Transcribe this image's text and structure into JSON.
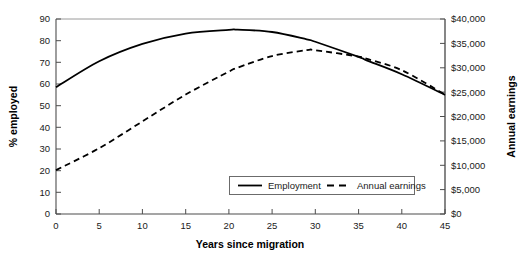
{
  "chart_data": {
    "type": "line",
    "title": "",
    "xlabel": "Years since migration",
    "ylabel": "% employed",
    "y2label": "Annual earnings",
    "xlim": [
      0,
      45
    ],
    "ylim": [
      0,
      90
    ],
    "y2lim": [
      0,
      40000
    ],
    "grid": false,
    "legend_position": "inside-bottom-center",
    "x_ticks": [
      "0",
      "5",
      "10",
      "15",
      "20",
      "25",
      "30",
      "35",
      "40",
      "45"
    ],
    "x_tick_values": [
      0,
      5,
      10,
      15,
      20,
      25,
      30,
      35,
      40,
      45
    ],
    "y_ticks": [
      "0",
      "10",
      "20",
      "30",
      "40",
      "50",
      "60",
      "70",
      "80",
      "90"
    ],
    "y_tick_values": [
      0,
      10,
      20,
      30,
      40,
      50,
      60,
      70,
      80,
      90
    ],
    "y2_ticks": [
      "$0",
      "$5,000",
      "$10,000",
      "$15,000",
      "$20,000",
      "$25,000",
      "$30,000",
      "$35,000",
      "$40,000"
    ],
    "y2_tick_values": [
      0,
      5000,
      10000,
      15000,
      20000,
      25000,
      30000,
      35000,
      40000
    ],
    "x": [
      0,
      5,
      10,
      15,
      20,
      21,
      25,
      29,
      30,
      35,
      36,
      40,
      45
    ],
    "series": [
      {
        "name": "Employment",
        "axis": "left",
        "style": "solid",
        "color": "#000000",
        "unit": "%",
        "values": [
          58.5,
          70.5,
          78.5,
          83.3,
          85.0,
          85.1,
          84.0,
          80.6,
          79.5,
          72.5,
          70.8,
          64.5,
          55.0
        ]
      },
      {
        "name": "Annual earnings",
        "axis": "right",
        "style": "dashed",
        "color": "#000000",
        "unit": "$",
        "values": [
          9000,
          13500,
          19000,
          24500,
          29200,
          30000,
          32400,
          33600,
          33600,
          32300,
          31800,
          29500,
          24500
        ]
      }
    ],
    "annotations": []
  },
  "legend": {
    "entries": [
      {
        "label": "Employment",
        "style": "solid"
      },
      {
        "label": "Annual earnings",
        "style": "dashed"
      }
    ]
  }
}
